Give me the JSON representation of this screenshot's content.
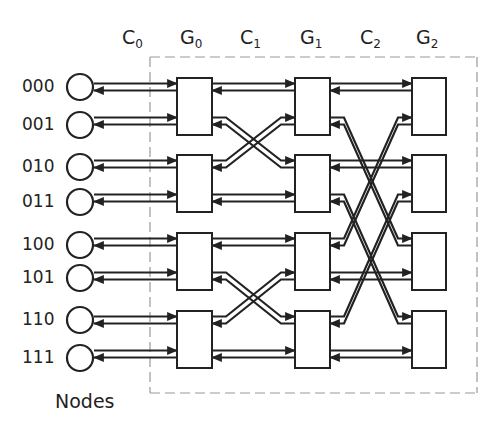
{
  "diagram": {
    "stages": [
      {
        "id": "C0",
        "letter": "C",
        "sub": "0",
        "x": 122
      },
      {
        "id": "G0",
        "letter": "G",
        "sub": "0",
        "x": 180
      },
      {
        "id": "C1",
        "letter": "C",
        "sub": "1",
        "x": 240
      },
      {
        "id": "G1",
        "letter": "G",
        "sub": "1",
        "x": 300
      },
      {
        "id": "C2",
        "letter": "C",
        "sub": "2",
        "x": 360
      },
      {
        "id": "G2",
        "letter": "G",
        "sub": "2",
        "x": 416
      }
    ],
    "nodes": [
      {
        "label": "000",
        "y": 87
      },
      {
        "label": "001",
        "y": 125
      },
      {
        "label": "010",
        "y": 167
      },
      {
        "label": "011",
        "y": 202
      },
      {
        "label": "100",
        "y": 245
      },
      {
        "label": "101",
        "y": 278
      },
      {
        "label": "110",
        "y": 320
      },
      {
        "label": "111",
        "y": 358
      }
    ],
    "nodes_caption": "Nodes",
    "switch_columns": [
      {
        "id": "G0",
        "x": 177,
        "w": 35
      },
      {
        "id": "G1",
        "x": 295,
        "w": 35
      },
      {
        "id": "G2",
        "x": 412,
        "w": 34
      }
    ],
    "switch_rows": [
      {
        "top": 78,
        "bottom": 135
      },
      {
        "top": 155,
        "bottom": 212
      },
      {
        "top": 233,
        "bottom": 290
      },
      {
        "top": 311,
        "bottom": 368
      }
    ],
    "connections": {
      "C1": [
        [
          0,
          "L",
          0,
          "U"
        ],
        [
          0,
          "U",
          0,
          "U"
        ],
        [
          0,
          "B",
          1,
          "U"
        ],
        [
          1,
          "U",
          0,
          "B"
        ],
        [
          1,
          "B",
          1,
          "B"
        ],
        [
          2,
          "U",
          2,
          "U"
        ],
        [
          2,
          "B",
          3,
          "U"
        ],
        [
          3,
          "U",
          2,
          "B"
        ],
        [
          3,
          "B",
          3,
          "B"
        ]
      ],
      "C2": [
        [
          0,
          "U",
          0,
          "U"
        ],
        [
          0,
          "B",
          2,
          "U"
        ],
        [
          1,
          "U",
          1,
          "U"
        ],
        [
          1,
          "B",
          3,
          "U"
        ],
        [
          2,
          "U",
          0,
          "B"
        ],
        [
          2,
          "B",
          2,
          "B"
        ],
        [
          3,
          "U",
          1,
          "B"
        ],
        [
          3,
          "B",
          3,
          "B"
        ]
      ]
    },
    "colors": {
      "line": "#222222",
      "dash": "#999999",
      "box_fill": "#ffffff"
    }
  }
}
